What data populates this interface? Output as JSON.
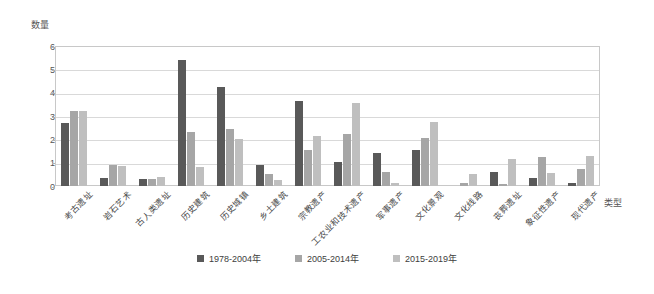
{
  "chart_data": {
    "type": "bar",
    "title": "",
    "ylabel": "数量",
    "xlabel": "类型",
    "ylim": [
      0,
      6
    ],
    "yticks": [
      0,
      1,
      2,
      3,
      4,
      5,
      6
    ],
    "grid": true,
    "legend_position": "bottom",
    "categories": [
      "考古遗址",
      "岩石艺术",
      "古人类遗址",
      "历史建筑",
      "历史城镇",
      "乡土建筑",
      "宗教遗产",
      "工农业和技术遗产",
      "军事遗产",
      "文化景观",
      "文化线路",
      "丧葬遗址",
      "象征性遗产",
      "现代遗产"
    ],
    "series": [
      {
        "name": "1978-2004年",
        "color": "#595959",
        "values": [
          2.7,
          0.35,
          0.3,
          5.4,
          4.25,
          0.9,
          3.65,
          1.05,
          1.4,
          1.55,
          0.0,
          0.6,
          0.35,
          0.15
        ]
      },
      {
        "name": "2005-2014年",
        "color": "#a6a6a6",
        "values": [
          3.2,
          0.9,
          0.3,
          2.3,
          2.45,
          0.5,
          1.55,
          2.25,
          0.6,
          2.05,
          0.15,
          0.08,
          1.25,
          0.75
        ]
      },
      {
        "name": "2015-2019年",
        "color": "#bfbfbf",
        "values": [
          3.2,
          0.85,
          0.4,
          0.8,
          2.0,
          0.25,
          2.15,
          3.55,
          0.15,
          2.75,
          0.5,
          1.15,
          0.55,
          1.3
        ]
      }
    ]
  },
  "legend": {
    "items": [
      {
        "label": "1978-2004年",
        "color": "#595959"
      },
      {
        "label": "2005-2014年",
        "color": "#a6a6a6"
      },
      {
        "label": "2015-2019年",
        "color": "#bfbfbf"
      }
    ]
  }
}
